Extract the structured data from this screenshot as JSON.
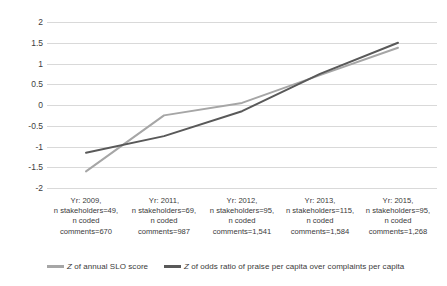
{
  "chart_data": {
    "type": "line",
    "title": "",
    "xlabel": "",
    "ylabel": "",
    "ylim": [
      -2,
      2
    ],
    "yticks": [
      2,
      1.5,
      1,
      0.5,
      0,
      -0.5,
      -1,
      -1.5,
      -2
    ],
    "ytick_labels": [
      "2",
      "1.5",
      "1",
      "0.5",
      "0",
      "-0.5",
      "-1",
      "-1.5",
      "-2"
    ],
    "grid": "horizontal",
    "legend_position": "bottom",
    "categories": [
      "Yr: 2009, n stakeholders=49, n coded comments=670",
      "Yr: 2011, n stakeholders=69, n coded comments=987",
      "Yr: 2012, n stakeholders=95, n coded comments=1,541",
      "Yr: 2013, n stakeholders=115, n coded comments=1,584",
      "Yr: 2015, n stakeholders=95, n coded comments=1,268"
    ],
    "category_lines": [
      [
        "Yr: 2009,",
        "n stakeholders=49,",
        "n coded",
        "comments=670"
      ],
      [
        "Yr: 2011,",
        "n stakeholders=69,",
        "n coded",
        "comments=987"
      ],
      [
        "Yr: 2012,",
        "n stakeholders=95,",
        "n coded",
        "comments=1,541"
      ],
      [
        "Yr: 2013,",
        "n stakeholders=115,",
        "n coded",
        "comments=1,584"
      ],
      [
        "Yr: 2015,",
        "n stakeholders=95,",
        "n coded",
        "comments=1,268"
      ]
    ],
    "series": [
      {
        "name": "Z of annual SLO score",
        "color": "#a6a6a6",
        "values": [
          -1.6,
          -0.25,
          0.05,
          0.72,
          1.38
        ]
      },
      {
        "name": "Z of odds ratio of praise per capita over complaints per capita",
        "color": "#595959",
        "values": [
          -1.15,
          -0.75,
          -0.15,
          0.75,
          1.5
        ]
      }
    ]
  },
  "legend": {
    "items": [
      {
        "label": "Z of annual SLO score"
      },
      {
        "label": "Z of odds ratio of praise per capita over complaints per capita"
      }
    ]
  },
  "colors": {
    "gridline": "#d9d9d9",
    "series_light": "#a6a6a6",
    "series_dark": "#595959",
    "text": "#3a3a3a",
    "background": "#ffffff"
  }
}
